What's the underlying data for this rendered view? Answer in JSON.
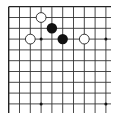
{
  "diagram": {
    "type": "go-board-fragment",
    "corner": "top-left",
    "columns": 10,
    "rows": 10,
    "open_edges": [
      "right",
      "bottom"
    ],
    "colors": {
      "background": "#ffffff",
      "line": "#333333",
      "edge": "#222222",
      "black_stone": "#111111",
      "white_stone_fill": "#ffffff",
      "white_stone_stroke": "#222222",
      "star_point": "#111111"
    },
    "star_points": [
      {
        "col": 3,
        "row": 3
      },
      {
        "col": 9,
        "row": 3
      },
      {
        "col": 3,
        "row": 9
      },
      {
        "col": 9,
        "row": 9
      }
    ],
    "stones": [
      {
        "color": "white",
        "col": 3,
        "row": 1
      },
      {
        "color": "black",
        "col": 4,
        "row": 2
      },
      {
        "color": "white",
        "col": 2,
        "row": 3
      },
      {
        "color": "black",
        "col": 5,
        "row": 3
      },
      {
        "color": "white",
        "col": 7,
        "row": 3
      }
    ]
  }
}
